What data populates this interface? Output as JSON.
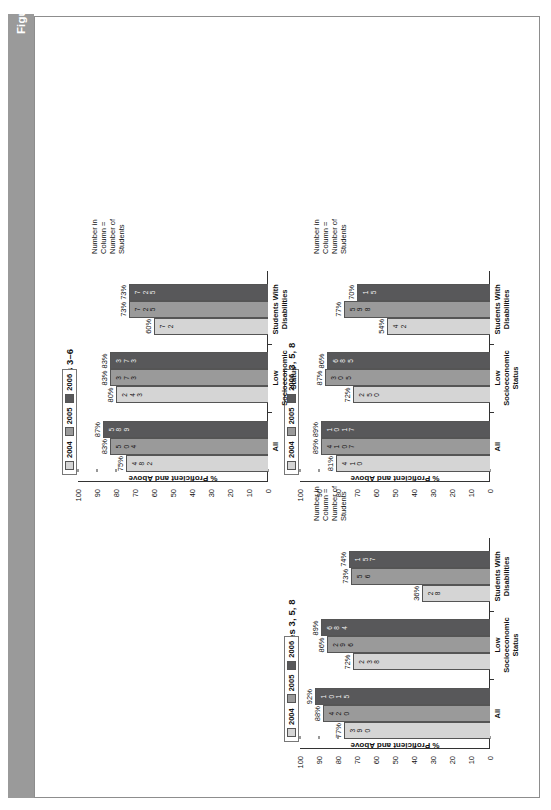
{
  "figure": {
    "number": "Figure 1.2",
    "caption": "Johnson County, Tennessee, Improves Mathematics, Reading, and Science Performance"
  },
  "legend": {
    "items": [
      {
        "label": "2004",
        "color": "#d5d5d5"
      },
      {
        "label": "2005",
        "color": "#9a9a9a"
      },
      {
        "label": "2006",
        "color": "#58585a"
      }
    ]
  },
  "note": "Number in\nColumn =\nNumber of\nStudents",
  "axis": {
    "ylabel": "% Proficient and Above",
    "ticks": [
      "100",
      "90",
      "80",
      "70",
      "60",
      "50",
      "40",
      "30",
      "20",
      "10",
      "0"
    ]
  },
  "chart_data": [
    {
      "type": "bar",
      "title": "Mathematics, Grades 3, 5, 8",
      "ylabel": "% Proficient and Above",
      "xlabel": "",
      "ylim": [
        0,
        100
      ],
      "grid": false,
      "legend_position": "bottom-right",
      "categories": [
        "All",
        "Low Socioeconomic Status",
        "Students With Disabilities"
      ],
      "series": [
        {
          "name": "2004",
          "color": "#d5d5d5",
          "values": [
            77,
            72,
            36
          ],
          "labels": [
            "77%",
            "72%",
            "36%"
          ],
          "counts": [
            "390",
            "238",
            "28"
          ]
        },
        {
          "name": "2005",
          "color": "#9a9a9a",
          "values": [
            88,
            86,
            73
          ],
          "labels": [
            "88%",
            "86%",
            "73%"
          ],
          "counts": [
            "420",
            "296",
            "56"
          ]
        },
        {
          "name": "2006",
          "color": "#58585a",
          "values": [
            92,
            89,
            74
          ],
          "labels": [
            "92%",
            "89%",
            "74%"
          ],
          "counts": [
            "1015",
            "684",
            "157"
          ]
        }
      ]
    },
    {
      "type": "bar",
      "title": "Reading, Grades 3, 5, 8",
      "ylabel": "% Proficient and Above",
      "xlabel": "",
      "ylim": [
        0,
        100
      ],
      "grid": false,
      "legend_position": "bottom-right",
      "categories": [
        "All",
        "Low Socioeconomic Status",
        "Students With Disabilities"
      ],
      "series": [
        {
          "name": "2004",
          "color": "#d5d5d5",
          "values": [
            81,
            72,
            54
          ],
          "labels": [
            "81%",
            "72%",
            "54%"
          ],
          "counts": [
            "410",
            "250",
            "42"
          ]
        },
        {
          "name": "2005",
          "color": "#9a9a9a",
          "values": [
            89,
            87,
            77
          ],
          "labels": [
            "89%",
            "87%",
            "77%"
          ],
          "counts": [
            "4107",
            "305",
            "598"
          ]
        },
        {
          "name": "2006",
          "color": "#58585a",
          "values": [
            89,
            86,
            70
          ],
          "labels": [
            "89%",
            "86%",
            "70%"
          ],
          "counts": [
            "1017",
            "685",
            "15"
          ]
        }
      ]
    },
    {
      "type": "bar",
      "title": "Science, Grades 3–6",
      "ylabel": "% Proficient and Above",
      "xlabel": "",
      "ylim": [
        0,
        100
      ],
      "grid": false,
      "legend_position": "bottom-right",
      "categories": [
        "All",
        "Low Socioeconomic Status",
        "Students With Disabilities"
      ],
      "series": [
        {
          "name": "2004",
          "color": "#d5d5d5",
          "values": [
            75,
            80,
            60
          ],
          "labels": [
            "75%",
            "80%",
            "60%"
          ],
          "counts": [
            "482",
            "243",
            "72"
          ]
        },
        {
          "name": "2005",
          "color": "#9a9a9a",
          "values": [
            83,
            83,
            73
          ],
          "labels": [
            "83%",
            "83%",
            "73%"
          ],
          "counts": [
            "504",
            "373",
            "725"
          ]
        },
        {
          "name": "2006",
          "color": "#58585a",
          "values": [
            87,
            83,
            73
          ],
          "labels": [
            "87%",
            "83%",
            "73%"
          ],
          "counts": [
            "589",
            "373",
            "725"
          ]
        }
      ]
    }
  ]
}
